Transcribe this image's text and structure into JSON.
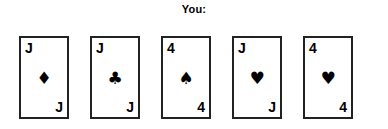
{
  "hand": {
    "label": "You:",
    "ink_color": "#000000",
    "card_border_color": "#222222",
    "card_face_color": "#ffffff",
    "background_color": "#ffffff",
    "cards": [
      {
        "rank": "J",
        "suit_name": "diamonds",
        "suit_symbol": "♦",
        "rank_top_left": "J",
        "rank_bottom_right": "J"
      },
      {
        "rank": "J",
        "suit_name": "clubs",
        "suit_symbol": "♣",
        "rank_top_left": "J",
        "rank_bottom_right": "J"
      },
      {
        "rank": "4",
        "suit_name": "spades",
        "suit_symbol": "♠",
        "rank_top_left": "4",
        "rank_bottom_right": "4"
      },
      {
        "rank": "J",
        "suit_name": "hearts",
        "suit_symbol": "♥",
        "rank_top_left": "J",
        "rank_bottom_right": "J"
      },
      {
        "rank": "4",
        "suit_name": "hearts",
        "suit_symbol": "♥",
        "rank_top_left": "4",
        "rank_bottom_right": "4"
      }
    ]
  }
}
